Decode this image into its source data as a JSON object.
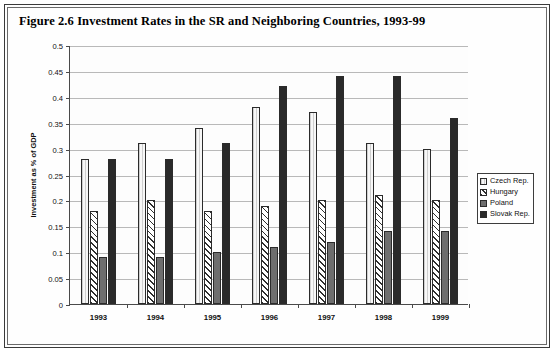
{
  "figure": {
    "title": "Figure 2.6  Investment Rates in the SR and Neighboring Countries, 1993-99"
  },
  "chart_data": {
    "type": "bar",
    "title": "Figure 2.6  Investment Rates in the SR and Neighboring Countries, 1993-99",
    "xlabel": "",
    "ylabel": "Investment as % of GDP",
    "categories": [
      "1993",
      "1994",
      "1995",
      "1996",
      "1997",
      "1998",
      "1999"
    ],
    "ylim": [
      0,
      0.5
    ],
    "ytick_labels": [
      "0",
      "0.05",
      "0.1",
      "0.15",
      "0.2",
      "0.25",
      "0.3",
      "0.35",
      "0.4",
      "0.45",
      "0.5"
    ],
    "ytick_values": [
      0,
      0.05,
      0.1,
      0.15,
      0.2,
      0.25,
      0.3,
      0.35,
      0.4,
      0.45,
      0.5
    ],
    "grid": true,
    "legend_position": "right",
    "series": [
      {
        "name": "Czech Rep.",
        "color": "#f2f2f2",
        "values": [
          0.28,
          0.31,
          0.34,
          0.38,
          0.37,
          0.31,
          0.3
        ]
      },
      {
        "name": "Hungary",
        "color": "#ffffff",
        "values": [
          0.18,
          0.2,
          0.18,
          0.19,
          0.2,
          0.21,
          0.2
        ]
      },
      {
        "name": "Poland",
        "color": "#6e6e6e",
        "values": [
          0.09,
          0.09,
          0.1,
          0.11,
          0.12,
          0.14,
          0.14
        ]
      },
      {
        "name": "Slovak Rep.",
        "color": "#2a2a2a",
        "values": [
          0.28,
          0.28,
          0.31,
          0.42,
          0.44,
          0.44,
          0.36
        ]
      }
    ]
  },
  "legend": {
    "items": [
      {
        "label": "Czech Rep."
      },
      {
        "label": "Hungary"
      },
      {
        "label": "Poland"
      },
      {
        "label": "Slovak Rep."
      }
    ]
  }
}
